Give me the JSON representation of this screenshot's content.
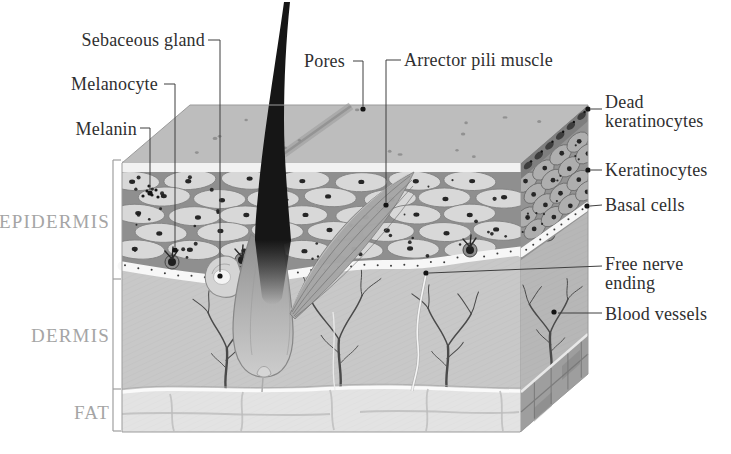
{
  "diagram": {
    "type": "skin-cross-section-illustration",
    "annotations": {
      "sebaceous_gland": "Sebaceous gland",
      "melanocyte": "Melanocyte",
      "melanin": "Melanin",
      "pores": "Pores",
      "arrector_pili_muscle": "Arrector pili muscle",
      "dead_keratinocytes": "Dead\nkeratinocytes",
      "keratinocytes": "Keratinocytes",
      "basal_cells": "Basal cells",
      "free_nerve_ending": "Free nerve\nending",
      "blood_vessels": "Blood vessels"
    },
    "layers": {
      "epidermis": "EPIDERMIS",
      "dermis": "DERMIS",
      "fat": "FAT"
    },
    "colors": {
      "background": "#ffffff",
      "label_text": "#2f2f2f",
      "layer_label_text": "#a5a5a5",
      "leader_line": "#3f3f3f",
      "leader_dot": "#141414",
      "top_face": "#bdbdbd",
      "top_strip": "#f2f2f2",
      "epidermis_bg": "#8f8f8f",
      "cell_fill": "#d8d8d8",
      "cell_stroke": "#828282",
      "nucleus": "#262626",
      "side_cell_bg": "#939393",
      "side_cell_fill": "#aeaeae",
      "dead_band": "#7e7e7e",
      "dead_cell": "#3d3d3d",
      "basal_band": "#f7f7f7",
      "dermis_fill": "#c8c8c8",
      "side_dermis_fill": "#b7b7b7",
      "fat_fill": "#e3e3e3",
      "side_fat_fill": "#9e9e9e",
      "vessel": "#4a4a4a",
      "hair": "#161616",
      "muscle_fill": "#a6a6a6",
      "gland_fill": "#d4d4d4",
      "edge_line": "#9b9b9b"
    }
  }
}
